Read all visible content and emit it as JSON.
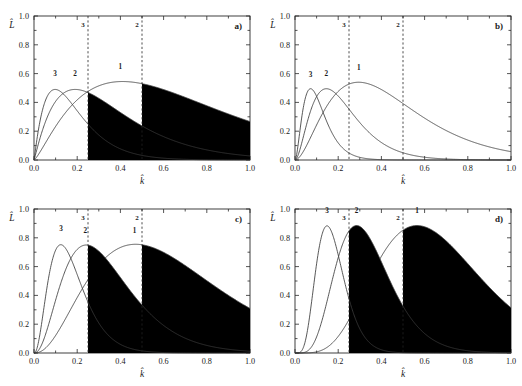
{
  "figure": {
    "width": 522,
    "height": 386,
    "background": "#ffffff",
    "ink": "#1a1a1a"
  },
  "axes": {
    "xlabel": "k̂",
    "ylabel": "L̂",
    "xlim": [
      0.0,
      1.0
    ],
    "ylim": [
      0.0,
      1.0
    ],
    "xticks": [
      0.0,
      0.2,
      0.4,
      0.6,
      0.8,
      1.0
    ],
    "yticks": [
      0.0,
      0.2,
      0.4,
      0.6,
      0.8,
      1.0
    ],
    "xtick_labels": [
      "0.0",
      "0.2",
      "0.4",
      "0.6",
      "0.8",
      "1.0"
    ],
    "ytick_labels": [
      "0.0",
      "0.2",
      "0.4",
      "0.6",
      "0.8",
      "1.0"
    ],
    "grid": false
  },
  "chart_data": [
    {
      "id": "a",
      "type": "line",
      "panel_label": "a)",
      "title": "",
      "xlabel": "k̂",
      "ylabel": "L̂",
      "xlim": [
        0.0,
        1.0
      ],
      "ylim": [
        0.0,
        1.0
      ],
      "grid": false,
      "legend": "inline curve numbers",
      "threshold_lines": [
        {
          "label": "3",
          "x": 0.25
        },
        {
          "label": "2",
          "x": 0.5
        }
      ],
      "series": [
        {
          "name": "1",
          "label_x": 0.4,
          "label_y": 0.63,
          "peak_x": 0.41,
          "peak_y": 0.545,
          "shape": "gamma",
          "k": 2.3,
          "scale": 0.315,
          "amp": 0.545,
          "shaded_tail_from": 0.5
        },
        {
          "name": "2",
          "label_x": 0.19,
          "label_y": 0.585,
          "peak_x": 0.19,
          "peak_y": 0.49,
          "shape": "gamma",
          "k": 2.1,
          "scale": 0.173,
          "amp": 0.49,
          "shaded_tail_from": 0.25
        },
        {
          "name": "3",
          "label_x": 0.098,
          "label_y": 0.585,
          "peak_x": 0.098,
          "peak_y": 0.49,
          "shape": "gamma",
          "k": 2.1,
          "scale": 0.089,
          "amp": 0.49,
          "shaded_tail_from": null
        }
      ]
    },
    {
      "id": "b",
      "type": "line",
      "panel_label": "b)",
      "title": "",
      "xlabel": "k̂",
      "ylabel": "L̂",
      "xlim": [
        0.0,
        1.0
      ],
      "ylim": [
        0.0,
        1.0
      ],
      "grid": false,
      "legend": "inline curve numbers",
      "threshold_lines": [
        {
          "label": "3",
          "x": 0.25
        },
        {
          "label": "2",
          "x": 0.5
        }
      ],
      "series": [
        {
          "name": "1",
          "label_x": 0.295,
          "label_y": 0.625,
          "peak_x": 0.295,
          "peak_y": 0.54,
          "shape": "gamma",
          "k": 2.9,
          "scale": 0.155,
          "amp": 0.54,
          "shaded_tail_from": null
        },
        {
          "name": "2",
          "label_x": 0.145,
          "label_y": 0.585,
          "peak_x": 0.145,
          "peak_y": 0.495,
          "shape": "gamma",
          "k": 2.9,
          "scale": 0.0765,
          "amp": 0.495,
          "shaded_tail_from": null
        },
        {
          "name": "3",
          "label_x": 0.072,
          "label_y": 0.575,
          "peak_x": 0.072,
          "peak_y": 0.495,
          "shape": "gamma",
          "k": 2.9,
          "scale": 0.038,
          "amp": 0.495,
          "shaded_tail_from": null
        }
      ]
    },
    {
      "id": "c",
      "type": "line",
      "panel_label": "c)",
      "title": "",
      "xlabel": "k̂",
      "ylabel": "L̂",
      "xlim": [
        0.0,
        1.0
      ],
      "ylim": [
        0.0,
        1.0
      ],
      "grid": false,
      "legend": "inline curve numbers",
      "threshold_lines": [
        {
          "label": "3",
          "x": 0.25
        },
        {
          "label": "2",
          "x": 0.5
        }
      ],
      "series": [
        {
          "name": "1",
          "label_x": 0.465,
          "label_y": 0.835,
          "peak_x": 0.47,
          "peak_y": 0.755,
          "shape": "gamma",
          "k": 3.4,
          "scale": 0.196,
          "amp": 0.755,
          "shaded_tail_from": 0.5
        },
        {
          "name": "2",
          "label_x": 0.238,
          "label_y": 0.835,
          "peak_x": 0.242,
          "peak_y": 0.75,
          "shape": "gamma",
          "k": 3.4,
          "scale": 0.101,
          "amp": 0.75,
          "shaded_tail_from": 0.25
        },
        {
          "name": "3",
          "label_x": 0.125,
          "label_y": 0.845,
          "peak_x": 0.124,
          "peak_y": 0.752,
          "shape": "gamma",
          "k": 3.4,
          "scale": 0.0517,
          "amp": 0.752,
          "shaded_tail_from": null
        }
      ]
    },
    {
      "id": "d",
      "type": "line",
      "panel_label": "d)",
      "title": "",
      "xlabel": "k̂",
      "ylabel": "L̂",
      "xlim": [
        0.0,
        1.0
      ],
      "ylim": [
        0.0,
        1.0
      ],
      "grid": false,
      "legend": "inline curve numbers",
      "threshold_lines": [
        {
          "label": "3",
          "x": 0.25
        },
        {
          "label": "2",
          "x": 0.5
        }
      ],
      "series": [
        {
          "name": "1",
          "label_x": 0.565,
          "label_y": 0.975,
          "peak_x": 0.565,
          "peak_y": 0.885,
          "shape": "gamma",
          "k": 6.2,
          "scale": 0.1086,
          "amp": 0.885,
          "shaded_tail_from": 0.5
        },
        {
          "name": "2",
          "label_x": 0.285,
          "label_y": 0.975,
          "peak_x": 0.285,
          "peak_y": 0.885,
          "shape": "gamma",
          "k": 6.2,
          "scale": 0.0548,
          "amp": 0.885,
          "shaded_tail_from": 0.25
        },
        {
          "name": "3",
          "label_x": 0.148,
          "label_y": 0.975,
          "peak_x": 0.148,
          "peak_y": 0.883,
          "shape": "gamma",
          "k": 6.2,
          "scale": 0.0285,
          "amp": 0.883,
          "shaded_tail_from": null
        }
      ]
    }
  ]
}
